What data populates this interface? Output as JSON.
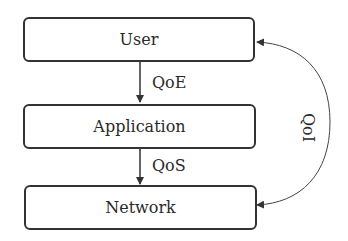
{
  "diagram": {
    "layers": [
      {
        "label": "User"
      },
      {
        "label": "Application"
      },
      {
        "label": "Network"
      }
    ],
    "links": [
      {
        "label": "QoE",
        "between": [
          "User",
          "Application"
        ]
      },
      {
        "label": "QoS",
        "between": [
          "Application",
          "Network"
        ]
      },
      {
        "label": "QoI",
        "between": [
          "Network",
          "User"
        ]
      }
    ],
    "colors": {
      "stroke": "#333333",
      "text": "#2a2a2a"
    }
  }
}
